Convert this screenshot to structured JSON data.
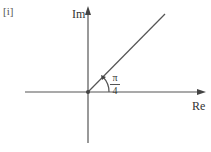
{
  "figure": {
    "label": "[i]",
    "axes": {
      "imaginary": "Im",
      "real": "Re"
    },
    "angle": {
      "numerator": "π",
      "denominator": "4"
    },
    "colors": {
      "line": "#555555",
      "text": "#333333"
    }
  }
}
